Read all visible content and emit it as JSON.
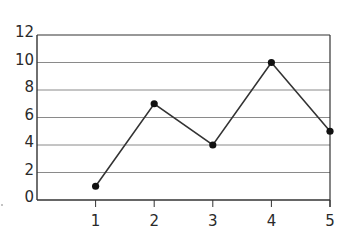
{
  "chart_data": {
    "type": "line",
    "title": "",
    "xlabel": "",
    "ylabel": "",
    "x": [
      1,
      2,
      3,
      4,
      5
    ],
    "values": [
      1,
      7,
      4,
      10,
      5
    ],
    "series": [
      {
        "name": "series-1",
        "values": [
          1,
          7,
          4,
          10,
          5
        ]
      }
    ],
    "xticks": [
      "1",
      "2",
      "3",
      "4",
      "5"
    ],
    "yticks": [
      "0",
      "2",
      "4",
      "6",
      "8",
      "10",
      "12"
    ],
    "ylim": [
      0,
      12
    ],
    "xlim": [
      0,
      5
    ],
    "grid": "horizontal",
    "legend": "none",
    "markers": true
  },
  "colors": {
    "line": "#333333",
    "grid": "#8a8a8a",
    "axis": "#333333",
    "text": "#2a2a2a"
  }
}
